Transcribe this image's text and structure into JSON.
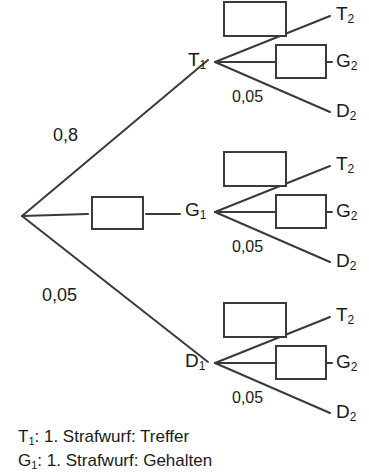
{
  "diagram": {
    "type": "probability-tree",
    "title_visible": false,
    "root": {
      "label": "",
      "x": 22,
      "y": 216
    },
    "colors": {
      "line": "#3a3a3a",
      "box_stroke": "#3a3a3a",
      "box_fill": "#ffffff",
      "text": "#1a1a1a",
      "background": "#ffffff"
    },
    "level1": {
      "branches": [
        {
          "id": "T1",
          "label": "T",
          "sub": "1",
          "probability": "0,8",
          "prob_shown_as": "text",
          "label_x": 188,
          "label_y": 52,
          "vertex_x": 215,
          "vertex_y": 62,
          "prob_x": 53,
          "prob_y": 125
        },
        {
          "id": "G1",
          "label": "G",
          "sub": "1",
          "probability": "",
          "prob_shown_as": "box",
          "label_x": 186,
          "label_y": 202,
          "vertex_x": 215,
          "vertex_y": 212,
          "box_x": 92,
          "box_y": 196,
          "box_w": 50,
          "box_h": 32
        },
        {
          "id": "D1",
          "label": "D",
          "sub": "1",
          "probability": "0,05",
          "prob_shown_as": "text",
          "label_x": 186,
          "label_y": 353,
          "vertex_x": 215,
          "vertex_y": 363,
          "prob_x": 42,
          "prob_y": 285
        }
      ]
    },
    "level2_template": {
      "branches": [
        {
          "id": "T2",
          "label": "T",
          "sub": "2",
          "probability": "",
          "prob_shown_as": "box"
        },
        {
          "id": "G2",
          "label": "G",
          "sub": "2",
          "probability": "",
          "prob_shown_as": "box"
        },
        {
          "id": "D2",
          "label": "D",
          "sub": "2",
          "probability": "0,05",
          "prob_shown_as": "text"
        }
      ]
    },
    "groups": [
      {
        "parent": "T1",
        "vertex_x": 215,
        "vertex_y": 62,
        "empty_box_top": {
          "x": 224,
          "y": 1,
          "w": 62,
          "h": 35
        },
        "empty_box_mid": {
          "x": 277,
          "y": 44,
          "w": 48,
          "h": 34
        },
        "leaves": [
          {
            "id": "T2",
            "label": "T",
            "sub": "2",
            "x": 336,
            "y": 6
          },
          {
            "id": "G2",
            "label": "G",
            "sub": "2",
            "x": 336,
            "y": 52
          },
          {
            "id": "D2",
            "label": "D",
            "sub": "2",
            "x": 336,
            "y": 103
          }
        ],
        "prob_text": {
          "value": "0,05",
          "x": 232,
          "y": 88
        }
      },
      {
        "parent": "G1",
        "vertex_x": 215,
        "vertex_y": 212,
        "empty_box_top": {
          "x": 224,
          "y": 151,
          "w": 62,
          "h": 35
        },
        "empty_box_mid": {
          "x": 277,
          "y": 194,
          "w": 48,
          "h": 34
        },
        "leaves": [
          {
            "id": "T2",
            "label": "T",
            "sub": "2",
            "x": 336,
            "y": 156
          },
          {
            "id": "G2",
            "label": "G",
            "sub": "2",
            "x": 336,
            "y": 202
          },
          {
            "id": "D2",
            "label": "D",
            "sub": "2",
            "x": 336,
            "y": 253
          }
        ],
        "prob_text": {
          "value": "0,05",
          "x": 232,
          "y": 238
        }
      },
      {
        "parent": "D1",
        "vertex_x": 215,
        "vertex_y": 363,
        "empty_box_top": {
          "x": 224,
          "y": 302,
          "w": 62,
          "h": 35
        },
        "empty_box_mid": {
          "x": 277,
          "y": 345,
          "w": 48,
          "h": 34
        },
        "leaves": [
          {
            "id": "T2",
            "label": "T",
            "sub": "2",
            "x": 336,
            "y": 307
          },
          {
            "id": "G2",
            "label": "G",
            "sub": "2",
            "x": 336,
            "y": 353
          },
          {
            "id": "D2",
            "label": "D",
            "sub": "2",
            "x": 336,
            "y": 404
          }
        ],
        "prob_text": {
          "value": "0,05",
          "x": 232,
          "y": 389
        }
      }
    ]
  },
  "legend": {
    "lines": [
      {
        "symbol": "T",
        "sub": "1",
        "text": ": 1. Strafwurf: Treffer",
        "y": 428
      },
      {
        "symbol": "G",
        "sub": "1",
        "text": ": 1. Strafwurf: Gehalten",
        "y": 452
      }
    ]
  }
}
